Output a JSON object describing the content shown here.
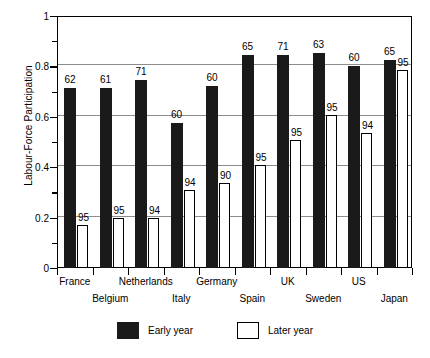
{
  "chart_data": {
    "type": "bar",
    "title": "",
    "xlabel": "",
    "ylabel": "Labour-Force Participation",
    "ylim": [
      0,
      1
    ],
    "yticks": [
      0,
      0.2,
      0.4,
      0.6,
      0.8,
      1
    ],
    "ytick_labels": [
      "0",
      "0.2",
      "0.4",
      "0.6",
      "0.8",
      "1"
    ],
    "yminor_ticks": [
      0.1,
      0.3,
      0.5,
      0.7,
      0.9
    ],
    "grid": "horizontal",
    "legend_position": "bottom-center",
    "categories": [
      "France",
      "Belgium",
      "Netherlands",
      "Italy",
      "Germany",
      "Spain",
      "UK",
      "Sweden",
      "US",
      "Japan"
    ],
    "series": [
      {
        "name": "Early year",
        "color": "#1a1a1a",
        "values": [
          0.714,
          0.714,
          0.746,
          0.575,
          0.722,
          0.845,
          0.845,
          0.853,
          0.802,
          0.826
        ],
        "point_labels": [
          "62",
          "61",
          "71",
          "60",
          "60",
          "65",
          "71",
          "63",
          "60",
          "65"
        ]
      },
      {
        "name": "Later year",
        "color": "#ffffff",
        "values": [
          0.171,
          0.199,
          0.199,
          0.31,
          0.337,
          0.409,
          0.507,
          0.607,
          0.536,
          0.786
        ],
        "point_labels": [
          "95",
          "95",
          "94",
          "94",
          "90",
          "95",
          "95",
          "95",
          "94",
          "95"
        ]
      }
    ]
  },
  "legend": {
    "items": [
      {
        "label": "Early year",
        "style": "early"
      },
      {
        "label": "Later year",
        "style": "later"
      }
    ]
  }
}
